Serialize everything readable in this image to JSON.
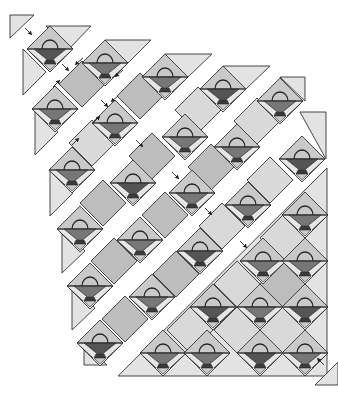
{
  "colors": {
    "background": "#ffffff",
    "outline": "#333333",
    "setting_triangle": "#e3e3e3",
    "block_bg_light": "#e6e6e6",
    "block_corner_mid": "#c9c9c9",
    "basket_dark": "#555555",
    "basket_mid": "#777777",
    "basket_base": "#3a3a3a",
    "setting_square_dark": "#bdbdbd",
    "setting_square_light": "#d9d9d9",
    "arrow": "#222222"
  },
  "grid": {
    "half_diagonal": 23
  },
  "baskets": [
    {
      "x": 50,
      "y": 49,
      "tone": "dark"
    },
    {
      "x": 105,
      "y": 63,
      "tone": "mid"
    },
    {
      "x": 55,
      "y": 109,
      "tone": "mid"
    },
    {
      "x": 165,
      "y": 77,
      "tone": "mid"
    },
    {
      "x": 115,
      "y": 123,
      "tone": "mid"
    },
    {
      "x": 72,
      "y": 170,
      "tone": "mid"
    },
    {
      "x": 223,
      "y": 89,
      "tone": "dark"
    },
    {
      "x": 185,
      "y": 137,
      "tone": "mid"
    },
    {
      "x": 133,
      "y": 183,
      "tone": "dark"
    },
    {
      "x": 80,
      "y": 229,
      "tone": "mid"
    },
    {
      "x": 280,
      "y": 101,
      "tone": "mid"
    },
    {
      "x": 237,
      "y": 147,
      "tone": "mid"
    },
    {
      "x": 192,
      "y": 193,
      "tone": "mid"
    },
    {
      "x": 140,
      "y": 240,
      "tone": "mid"
    },
    {
      "x": 90,
      "y": 286,
      "tone": "mid"
    },
    {
      "x": 302,
      "y": 159,
      "tone": "dark"
    },
    {
      "x": 248,
      "y": 205,
      "tone": "mid"
    },
    {
      "x": 200,
      "y": 251,
      "tone": "dark"
    },
    {
      "x": 152,
      "y": 297,
      "tone": "mid"
    },
    {
      "x": 100,
      "y": 343,
      "tone": "dark"
    },
    {
      "x": 305,
      "y": 215,
      "tone": "mid"
    },
    {
      "x": 263,
      "y": 261,
      "tone": "mid"
    },
    {
      "x": 305,
      "y": 261,
      "tone": "mid"
    },
    {
      "x": 213,
      "y": 307,
      "tone": "dark"
    },
    {
      "x": 260,
      "y": 307,
      "tone": "mid"
    },
    {
      "x": 305,
      "y": 307,
      "tone": "dark"
    },
    {
      "x": 163,
      "y": 353,
      "tone": "mid"
    },
    {
      "x": 207,
      "y": 353,
      "tone": "mid"
    },
    {
      "x": 260,
      "y": 353,
      "tone": "dark"
    },
    {
      "x": 305,
      "y": 353,
      "tone": "mid"
    }
  ],
  "setting_squares": [
    {
      "x": 82,
      "y": 84,
      "tone": "dark"
    },
    {
      "x": 140,
      "y": 96,
      "tone": "dark"
    },
    {
      "x": 92,
      "y": 143,
      "tone": "light"
    },
    {
      "x": 198,
      "y": 110,
      "tone": "light"
    },
    {
      "x": 152,
      "y": 156,
      "tone": "dark"
    },
    {
      "x": 103,
      "y": 203,
      "tone": "dark"
    },
    {
      "x": 257,
      "y": 121,
      "tone": "light"
    },
    {
      "x": 211,
      "y": 167,
      "tone": "dark"
    },
    {
      "x": 165,
      "y": 215,
      "tone": "dark"
    },
    {
      "x": 114,
      "y": 261,
      "tone": "dark"
    },
    {
      "x": 270,
      "y": 180,
      "tone": "light"
    },
    {
      "x": 222,
      "y": 226,
      "tone": "light"
    },
    {
      "x": 176,
      "y": 274,
      "tone": "dark"
    },
    {
      "x": 125,
      "y": 319,
      "tone": "dark"
    },
    {
      "x": 283,
      "y": 238,
      "tone": "light"
    },
    {
      "x": 237,
      "y": 284,
      "tone": "light"
    },
    {
      "x": 283,
      "y": 284,
      "tone": "dark"
    },
    {
      "x": 190,
      "y": 330,
      "tone": "light"
    },
    {
      "x": 237,
      "y": 330,
      "tone": "light"
    },
    {
      "x": 283,
      "y": 330,
      "tone": "light"
    }
  ],
  "setting_triangles": [
    {
      "points": "10,15 34,15 10,38"
    },
    {
      "points": "46,26 91,26 69,49"
    },
    {
      "points": "23,49 23,95 46,72"
    },
    {
      "points": "105,40 151,40 128,63"
    },
    {
      "points": "35,109 35,155 58,132"
    },
    {
      "points": "165,54 212,54 188,77"
    },
    {
      "points": "50,170 50,216 73,193"
    },
    {
      "points": "223,66 270,66 246,89"
    },
    {
      "points": "62,229 62,273 85,251"
    },
    {
      "points": "280,77 305,77 305,101"
    },
    {
      "points": "72,286 72,330 95,308"
    },
    {
      "points": "300,112 326,112 326,159"
    },
    {
      "points": "84,343 84,365 107,365"
    },
    {
      "points": "326,169 326,215 303,192"
    },
    {
      "points": "118,376 327,376 327,168"
    },
    {
      "points": "315,385 338,385 338,362"
    }
  ],
  "arrows": [
    {
      "x1": 25,
      "y1": 28,
      "x2": 31,
      "y2": 34
    },
    {
      "x1": 62,
      "y1": 64,
      "x2": 68,
      "y2": 70
    },
    {
      "x1": 83,
      "y1": 58,
      "x2": 76,
      "y2": 64
    },
    {
      "x1": 53,
      "y1": 87,
      "x2": 59,
      "y2": 81
    },
    {
      "x1": 101,
      "y1": 100,
      "x2": 107,
      "y2": 106
    },
    {
      "x1": 123,
      "y1": 70,
      "x2": 116,
      "y2": 76
    },
    {
      "x1": 118,
      "y1": 96,
      "x2": 112,
      "y2": 101
    },
    {
      "x1": 93,
      "y1": 123,
      "x2": 99,
      "y2": 117
    },
    {
      "x1": 72,
      "y1": 145,
      "x2": 78,
      "y2": 139
    },
    {
      "x1": 136,
      "y1": 140,
      "x2": 142,
      "y2": 146
    },
    {
      "x1": 172,
      "y1": 172,
      "x2": 178,
      "y2": 178
    },
    {
      "x1": 205,
      "y1": 208,
      "x2": 211,
      "y2": 214
    },
    {
      "x1": 240,
      "y1": 241,
      "x2": 246,
      "y2": 247
    },
    {
      "x1": 324,
      "y1": 365,
      "x2": 318,
      "y2": 359
    }
  ]
}
